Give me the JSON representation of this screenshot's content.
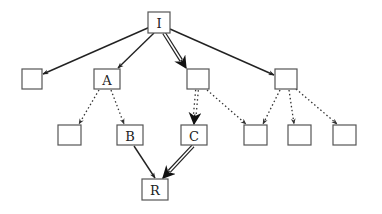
{
  "diagram": {
    "type": "tree-graph",
    "nodes": [
      {
        "id": "I",
        "label": "I",
        "x": 148,
        "y": 12,
        "w": 22,
        "h": 21
      },
      {
        "id": "L1",
        "label": "",
        "x": 22,
        "y": 69,
        "w": 20,
        "h": 20
      },
      {
        "id": "A",
        "label": "A",
        "x": 94,
        "y": 69,
        "w": 26,
        "h": 20
      },
      {
        "id": "M",
        "label": "",
        "x": 187,
        "y": 69,
        "w": 22,
        "h": 20
      },
      {
        "id": "N",
        "label": "",
        "x": 275,
        "y": 69,
        "w": 22,
        "h": 20
      },
      {
        "id": "E",
        "label": "",
        "x": 58,
        "y": 125,
        "w": 23,
        "h": 20
      },
      {
        "id": "B",
        "label": "B",
        "x": 117,
        "y": 125,
        "w": 26,
        "h": 20
      },
      {
        "id": "C",
        "label": "C",
        "x": 181,
        "y": 125,
        "w": 26,
        "h": 20
      },
      {
        "id": "D1",
        "label": "",
        "x": 244,
        "y": 125,
        "w": 23,
        "h": 20
      },
      {
        "id": "D2",
        "label": "",
        "x": 288,
        "y": 125,
        "w": 23,
        "h": 20
      },
      {
        "id": "D3",
        "label": "",
        "x": 333,
        "y": 125,
        "w": 23,
        "h": 20
      },
      {
        "id": "R",
        "label": "R",
        "x": 142,
        "y": 179,
        "w": 26,
        "h": 21
      }
    ],
    "edges": [
      {
        "from": "I",
        "to": "L1",
        "style": "solid",
        "x1": 150,
        "y1": 27,
        "x2": 43,
        "y2": 74
      },
      {
        "from": "I",
        "to": "A",
        "style": "solid",
        "x1": 154,
        "y1": 33,
        "x2": 118,
        "y2": 68
      },
      {
        "from": "I",
        "to": "M",
        "style": "double",
        "x1": 164,
        "y1": 33,
        "x2": 186,
        "y2": 68
      },
      {
        "from": "I",
        "to": "N",
        "style": "solid",
        "x1": 170,
        "y1": 29,
        "x2": 274,
        "y2": 75
      },
      {
        "from": "A",
        "to": "E",
        "style": "dotted",
        "x1": 99,
        "y1": 90,
        "x2": 79,
        "y2": 124
      },
      {
        "from": "A",
        "to": "B",
        "style": "dotted",
        "x1": 111,
        "y1": 90,
        "x2": 124,
        "y2": 124
      },
      {
        "from": "M",
        "to": "C",
        "style": "dotted-double",
        "x1": 197,
        "y1": 90,
        "x2": 194,
        "y2": 124
      },
      {
        "from": "M",
        "to": "D1",
        "style": "dotted",
        "x1": 207,
        "y1": 90,
        "x2": 246,
        "y2": 124
      },
      {
        "from": "N",
        "to": "D1",
        "style": "dotted",
        "x1": 280,
        "y1": 90,
        "x2": 263,
        "y2": 124
      },
      {
        "from": "N",
        "to": "D2",
        "style": "dotted",
        "x1": 289,
        "y1": 90,
        "x2": 294,
        "y2": 124
      },
      {
        "from": "N",
        "to": "D3",
        "style": "dotted",
        "x1": 296,
        "y1": 89,
        "x2": 337,
        "y2": 124
      },
      {
        "from": "B",
        "to": "R",
        "style": "solid",
        "x1": 134,
        "y1": 146,
        "x2": 155,
        "y2": 178
      },
      {
        "from": "C",
        "to": "R",
        "style": "double",
        "x1": 193,
        "y1": 146,
        "x2": 163,
        "y2": 178
      }
    ],
    "colors": {
      "node_border": "#555555",
      "edge": "#222222",
      "background": "#ffffff"
    }
  }
}
